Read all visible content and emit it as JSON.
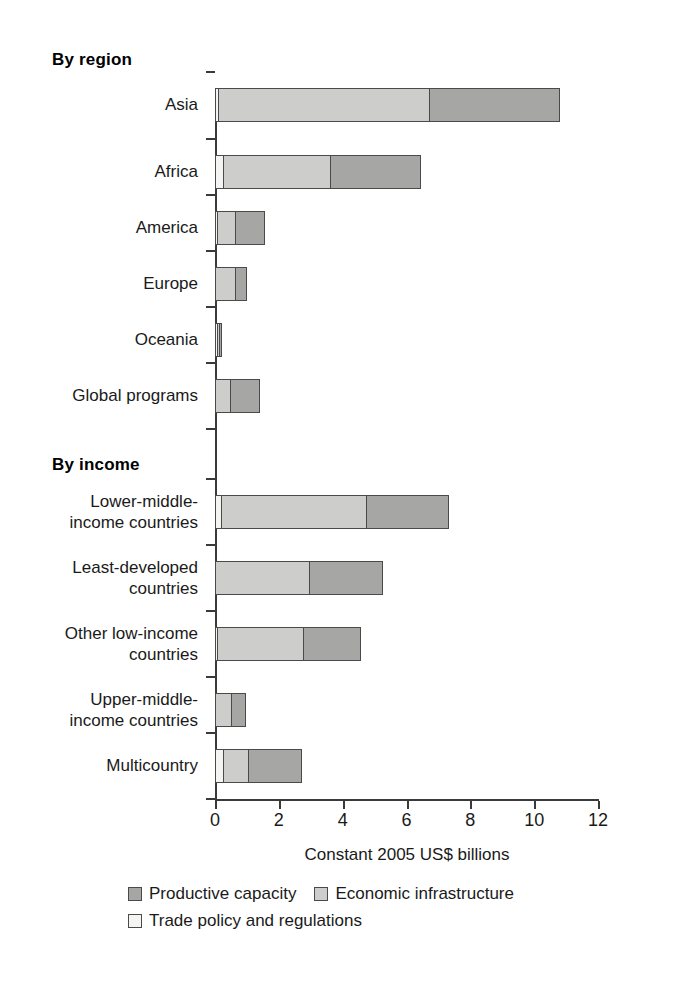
{
  "chart_data": {
    "type": "bar",
    "orientation": "horizontal",
    "stacked": true,
    "title": "",
    "xlabel": "Constant 2005 US$ billions",
    "ylabel": "",
    "xlim": [
      0,
      12
    ],
    "xticks": [
      0,
      2,
      4,
      6,
      8,
      10,
      12
    ],
    "xticklabels": [
      "0",
      "2",
      "4",
      "6",
      "8",
      "10",
      "12"
    ],
    "grid": false,
    "legend_position": "bottom",
    "group_headings": [
      "By region",
      "By income"
    ],
    "series": [
      {
        "name": "Trade policy and regulations",
        "color": "#f4f4f2",
        "values": [
          0.12,
          0.28,
          0.03,
          0.0,
          0.02,
          0.0,
          0.22,
          0.0,
          0.07,
          0.0,
          0.28
        ]
      },
      {
        "name": "Economic infrastructure",
        "color": "#cdcdcb",
        "values": [
          6.65,
          3.39,
          0.6,
          0.66,
          0.08,
          0.5,
          4.58,
          2.98,
          2.72,
          0.53,
          0.82
        ]
      },
      {
        "name": "Productive capacity",
        "color": "#a6a6a4",
        "values": [
          4.11,
          2.85,
          0.94,
          0.37,
          0.06,
          0.94,
          2.59,
          2.32,
          1.82,
          0.47,
          1.69
        ]
      }
    ],
    "categories": [
      "Asia",
      "Africa",
      "America",
      "Europe",
      "Oceania",
      "Global programs",
      "Lower-middle-income countries",
      "Least-developed countries",
      "Other low-income countries",
      "Upper-middle-income countries",
      "Multicountry"
    ],
    "totals": [
      10.88,
      6.52,
      1.57,
      1.03,
      0.16,
      1.44,
      7.59,
      5.3,
      4.61,
      1.0,
      2.79
    ]
  },
  "axis": {
    "x_title": "Constant 2005 US$ billions",
    "ticks": [
      "0",
      "2",
      "4",
      "6",
      "8",
      "10",
      "12"
    ]
  },
  "sections": {
    "region": {
      "heading": "By region",
      "rows": [
        {
          "label_line1": "Asia",
          "label_line2": "",
          "trade": 0.12,
          "econ": 6.65,
          "prod": 4.11,
          "total": 10.88
        },
        {
          "label_line1": "Africa",
          "label_line2": "",
          "trade": 0.28,
          "econ": 3.39,
          "prod": 2.85,
          "total": 6.52
        },
        {
          "label_line1": "America",
          "label_line2": "",
          "trade": 0.03,
          "econ": 0.6,
          "prod": 0.94,
          "total": 1.57
        },
        {
          "label_line1": "Europe",
          "label_line2": "",
          "trade": 0.0,
          "econ": 0.66,
          "prod": 0.37,
          "total": 1.03
        },
        {
          "label_line1": "Oceania",
          "label_line2": "",
          "trade": 0.02,
          "econ": 0.08,
          "prod": 0.06,
          "total": 0.16
        },
        {
          "label_line1": "Global programs",
          "label_line2": "",
          "trade": 0.0,
          "econ": 0.5,
          "prod": 0.94,
          "total": 1.44
        }
      ]
    },
    "income": {
      "heading": "By income",
      "rows": [
        {
          "label_line1": "Lower-middle-",
          "label_line2": "income countries",
          "trade": 0.22,
          "econ": 4.58,
          "prod": 2.59,
          "total": 7.59
        },
        {
          "label_line1": "Least-developed",
          "label_line2": "countries",
          "trade": 0.0,
          "econ": 2.98,
          "prod": 2.32,
          "total": 5.3
        },
        {
          "label_line1": "Other low-income",
          "label_line2": "countries",
          "trade": 0.07,
          "econ": 2.72,
          "prod": 1.82,
          "total": 4.61
        },
        {
          "label_line1": "Upper-middle-",
          "label_line2": "income countries",
          "trade": 0.0,
          "econ": 0.53,
          "prod": 0.47,
          "total": 1.0
        },
        {
          "label_line1": "Multicountry",
          "label_line2": "",
          "trade": 0.28,
          "econ": 0.82,
          "prod": 1.69,
          "total": 2.79
        }
      ]
    }
  },
  "legend": {
    "items": [
      {
        "label": "Productive capacity",
        "color": "#a6a6a4",
        "key": "prod"
      },
      {
        "label": "Economic infrastructure",
        "color": "#cdcdcb",
        "key": "econ"
      },
      {
        "label": "Trade policy and regulations",
        "color": "#f4f4f2",
        "key": "trade"
      }
    ]
  }
}
